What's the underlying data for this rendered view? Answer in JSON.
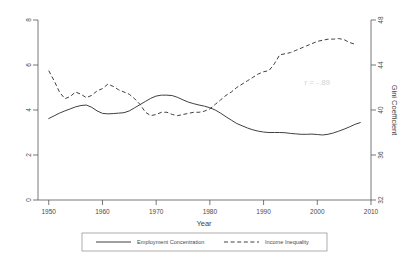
{
  "chart_data": {
    "type": "line",
    "title": "",
    "xlabel": "Year",
    "ylabel": "",
    "y2label": "Gini Coefficient",
    "xlim": [
      1948,
      2010
    ],
    "ylim": [
      0,
      8
    ],
    "y2lim": [
      32,
      48
    ],
    "grid": false,
    "legend_position": "bottom",
    "xticks": [
      1950,
      1960,
      1970,
      1980,
      1990,
      2000,
      2010
    ],
    "xticklabels": [
      "1950",
      "1960",
      "1970",
      "1980",
      "1990",
      "2000",
      "2010"
    ],
    "yticks": [
      0,
      2,
      4,
      6,
      8
    ],
    "yticklabels": [
      "0",
      "2",
      "4",
      "6",
      "8"
    ],
    "y2ticks": [
      32,
      36,
      40,
      44,
      48
    ],
    "y2ticklabels": [
      "32",
      "36",
      "40",
      "44",
      "48"
    ],
    "annotations": [
      {
        "text": "r = -.89",
        "x": 2000,
        "y": 5.1
      }
    ],
    "series": [
      {
        "name": "Employment Concentration",
        "style": "solid",
        "axis": "left",
        "x": [
          1950,
          1951,
          1952,
          1953,
          1954,
          1955,
          1956,
          1957,
          1958,
          1959,
          1960,
          1961,
          1962,
          1963,
          1964,
          1965,
          1966,
          1967,
          1968,
          1969,
          1970,
          1971,
          1972,
          1973,
          1974,
          1975,
          1976,
          1977,
          1978,
          1979,
          1980,
          1981,
          1982,
          1983,
          1984,
          1985,
          1986,
          1987,
          1988,
          1989,
          1990,
          1991,
          1992,
          1993,
          1994,
          1995,
          1996,
          1997,
          1998,
          1999,
          2000,
          2001,
          2002,
          2003,
          2004,
          2005,
          2006,
          2007,
          2008
        ],
        "values": [
          3.62,
          3.74,
          3.86,
          3.96,
          4.05,
          4.14,
          4.2,
          4.22,
          4.12,
          3.96,
          3.85,
          3.83,
          3.84,
          3.86,
          3.88,
          3.96,
          4.1,
          4.24,
          4.38,
          4.52,
          4.62,
          4.66,
          4.66,
          4.64,
          4.56,
          4.45,
          4.35,
          4.28,
          4.22,
          4.17,
          4.1,
          4.0,
          3.86,
          3.7,
          3.55,
          3.4,
          3.3,
          3.2,
          3.12,
          3.06,
          3.02,
          3.0,
          3.0,
          3.0,
          2.99,
          2.96,
          2.94,
          2.92,
          2.92,
          2.93,
          2.91,
          2.89,
          2.92,
          2.98,
          3.06,
          3.15,
          3.25,
          3.36,
          3.44
        ]
      },
      {
        "name": "Income Inequality",
        "style": "dashed",
        "axis": "right",
        "x": [
          1950,
          1951,
          1952,
          1953,
          1954,
          1955,
          1956,
          1957,
          1958,
          1959,
          1960,
          1961,
          1962,
          1963,
          1964,
          1965,
          1966,
          1967,
          1968,
          1969,
          1970,
          1971,
          1972,
          1973,
          1974,
          1975,
          1976,
          1977,
          1978,
          1979,
          1980,
          1981,
          1982,
          1983,
          1984,
          1985,
          1986,
          1987,
          1988,
          1989,
          1990,
          1991,
          1992,
          1993,
          1994,
          1995,
          1996,
          1997,
          1998,
          1999,
          2000,
          2001,
          2002,
          2003,
          2004,
          2005,
          2006,
          2007
        ],
        "values": [
          43.5,
          42.6,
          41.6,
          41.0,
          41.2,
          41.6,
          41.4,
          41.1,
          41.3,
          41.7,
          41.9,
          42.3,
          42.1,
          41.8,
          41.6,
          41.4,
          41.0,
          40.5,
          39.8,
          39.5,
          39.6,
          39.8,
          39.8,
          39.6,
          39.5,
          39.6,
          39.7,
          39.8,
          39.8,
          39.9,
          40.1,
          40.5,
          40.9,
          41.3,
          41.6,
          42.0,
          42.3,
          42.6,
          42.9,
          43.2,
          43.4,
          43.5,
          44.1,
          44.9,
          45.0,
          45.1,
          45.3,
          45.5,
          45.7,
          45.9,
          46.1,
          46.2,
          46.3,
          46.3,
          46.35,
          46.25,
          46.0,
          45.85
        ]
      }
    ]
  },
  "legend": {
    "entries": [
      {
        "label": "Employment Concentration",
        "style": "solid"
      },
      {
        "label": "Income Inequality",
        "style": "dashed"
      }
    ]
  }
}
